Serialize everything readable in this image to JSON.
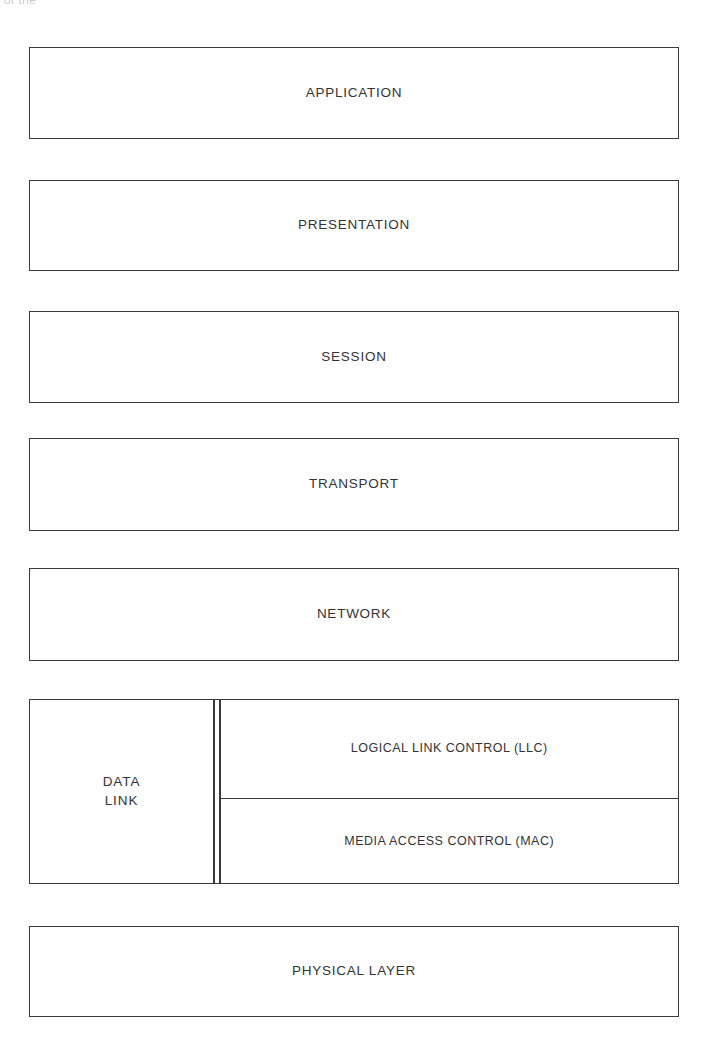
{
  "diagram": {
    "page_background": "#fefefe",
    "line_color": "#3a3a3c",
    "text_color": "#333336",
    "scan_artifact_text": "of the",
    "layers": [
      {
        "id": "application",
        "label": "APPLICATION",
        "level": 7,
        "compound": false
      },
      {
        "id": "presentation",
        "label": "PRESENTATION",
        "level": 6,
        "compound": false
      },
      {
        "id": "session",
        "label": "SESSION",
        "level": 5,
        "compound": false
      },
      {
        "id": "transport",
        "label": "TRANSPORT",
        "level": 4,
        "compound": false
      },
      {
        "id": "network",
        "label": "NETWORK",
        "level": 3,
        "compound": false
      },
      {
        "id": "datalink",
        "label_line_1": "DATA",
        "label_line_2": "LINK",
        "level": 2,
        "compound": true,
        "sublayers": [
          {
            "id": "llc",
            "label": "LOGICAL LINK CONTROL (LLC)"
          },
          {
            "id": "mac",
            "label": "MEDIA ACCESS CONTROL (MAC)"
          }
        ]
      },
      {
        "id": "physical",
        "label": "PHYSICAL LAYER",
        "level": 1,
        "compound": false
      }
    ]
  }
}
